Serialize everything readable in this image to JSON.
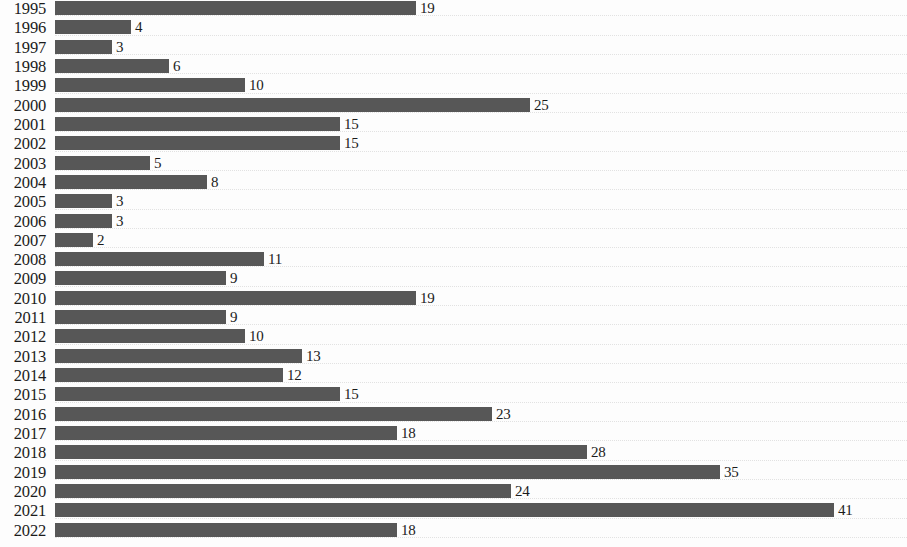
{
  "chart_data": {
    "type": "bar",
    "orientation": "horizontal",
    "title": "",
    "subtitle": "",
    "xlabel": "",
    "ylabel": "",
    "categories": [
      "1995",
      "1996",
      "1997",
      "1998",
      "1999",
      "2000",
      "2001",
      "2002",
      "2003",
      "2004",
      "2005",
      "2006",
      "2007",
      "2008",
      "2009",
      "2010",
      "2011",
      "2012",
      "2013",
      "2014",
      "2015",
      "2016",
      "2017",
      "2018",
      "2019",
      "2020",
      "2021",
      "2022"
    ],
    "values": [
      19,
      4,
      3,
      6,
      10,
      25,
      15,
      15,
      5,
      8,
      3,
      3,
      2,
      11,
      9,
      19,
      9,
      10,
      13,
      12,
      15,
      23,
      18,
      28,
      35,
      24,
      41,
      18
    ],
    "value_labels": [
      "19",
      "4",
      "3",
      "6",
      "10",
      "25",
      "15",
      "15",
      "5",
      "8",
      "3",
      "3",
      "2",
      "11",
      "9",
      "19",
      "9",
      "10",
      "13",
      "12",
      "15",
      "23",
      "18",
      "28",
      "35",
      "24",
      "41",
      "18"
    ],
    "xlim": [
      0,
      45
    ],
    "ylim": null,
    "grid": true,
    "grid_axis": "y",
    "legend": null,
    "legend_position": "none",
    "annotations": [],
    "data_labels_shown": true,
    "bar_color": "#575757",
    "gridline_color": "#e2e2e2",
    "background_color": "#fdfdfd",
    "text_color": "#1b1b1b"
  },
  "layout": {
    "pixels_per_unit": 19.0,
    "row_height": 19.32,
    "bar_thickness": 14,
    "plot_left": 55,
    "first_row_top": -2
  }
}
